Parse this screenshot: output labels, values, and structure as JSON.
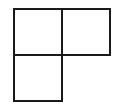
{
  "diagram": {
    "type": "polyomino-grid",
    "stroke_color": "#1a1a1a",
    "fill_color": "#ffffff",
    "cells": [
      {
        "id": "top-left",
        "row": 0,
        "col": 0,
        "x": 13,
        "y": 8,
        "size": 50
      },
      {
        "id": "top-right",
        "row": 0,
        "col": 1,
        "x": 61,
        "y": 8,
        "size": 50
      },
      {
        "id": "bottom-left",
        "row": 1,
        "col": 0,
        "x": 13,
        "y": 54,
        "size": 49
      }
    ]
  }
}
